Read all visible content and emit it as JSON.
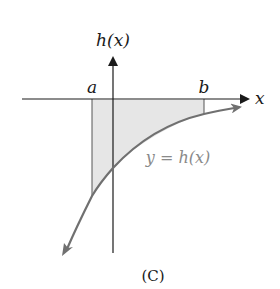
{
  "diagram": {
    "y_axis_label": "h(x)",
    "x_axis_label": "x",
    "bound_a_label": "a",
    "bound_b_label": "b",
    "curve_label": "y = h(x)",
    "caption": "(C)",
    "colors": {
      "axis": "#1a1a1a",
      "curve": "#707070",
      "shade": "#e6e6e6",
      "label": "#1a1a1a",
      "curve_label": "#8a8a8a"
    }
  }
}
